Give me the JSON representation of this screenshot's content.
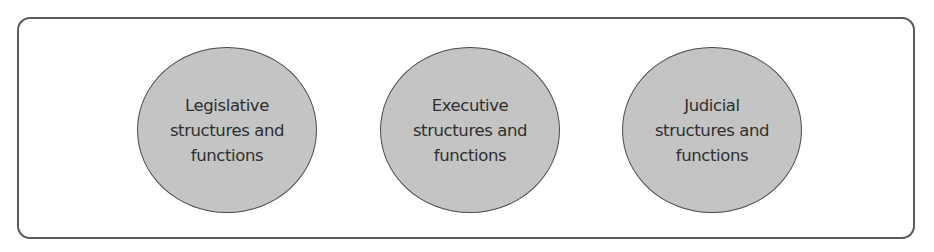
{
  "diagram": {
    "container": {
      "shape": "rounded-rectangle",
      "border_color": "#5a5a5a",
      "fill": "#ffffff"
    },
    "nodes": [
      {
        "label": "Legislative\nstructures and\nfunctions",
        "shape": "ellipse",
        "fill": "#c4c4c4"
      },
      {
        "label": "Executive\nstructures and\nfunctions",
        "shape": "ellipse",
        "fill": "#c4c4c4"
      },
      {
        "label": "Judicial\nstructures and\nfunctions",
        "shape": "ellipse",
        "fill": "#c4c4c4"
      }
    ],
    "edges": []
  }
}
